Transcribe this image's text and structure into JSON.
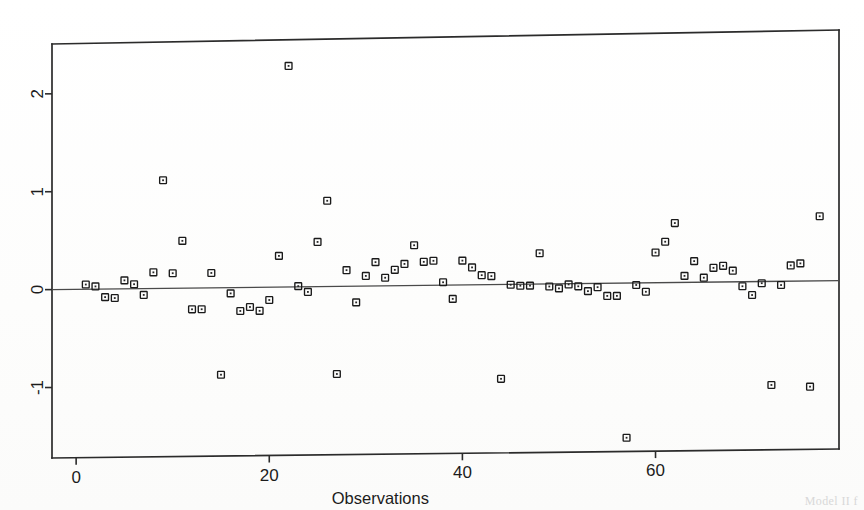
{
  "figure": {
    "kind": "scatter-residual-plot",
    "background": "#ffffff",
    "ink_color": "#1c1c1c",
    "frame": {
      "left": 52,
      "top": 40,
      "right": 839,
      "bottom": 458
    },
    "caption_fragment": "Model II f"
  },
  "chart_data": {
    "type": "scatter",
    "title": "",
    "subtitle": "",
    "xlabel": "Observations",
    "ylabel": "",
    "xlim": [
      -2.5,
      79
    ],
    "ylim": [
      -1.72,
      2.55
    ],
    "xticks": [
      0,
      20,
      40,
      60
    ],
    "xticklabels": [
      "0",
      "20",
      "40",
      "60"
    ],
    "yticks": [
      2,
      1,
      0,
      -1
    ],
    "yticklabels": [
      "2",
      "1",
      "0",
      "-1"
    ],
    "ytick_label_rotation": -90,
    "grid": false,
    "legend": null,
    "marker": "open-square",
    "reference_lines": [
      {
        "orientation": "horizontal",
        "y": 0.0,
        "style": "solid",
        "color": "#4a4a4a"
      }
    ],
    "series": [
      {
        "name": "residuals",
        "x": [
          1,
          2,
          3,
          4,
          5,
          6,
          7,
          8,
          9,
          10,
          11,
          12,
          13,
          14,
          15,
          16,
          17,
          18,
          19,
          20,
          21,
          22,
          23,
          24,
          25,
          26,
          27,
          28,
          29,
          30,
          31,
          32,
          33,
          34,
          35,
          36,
          37,
          38,
          39,
          40,
          41,
          42,
          43,
          44,
          45,
          46,
          47,
          48,
          49,
          50,
          51,
          52,
          53,
          54,
          55,
          56,
          57,
          58,
          59,
          60,
          61,
          62,
          63,
          64,
          65,
          66,
          67,
          68,
          69,
          70,
          71,
          72,
          73,
          74,
          75,
          76,
          77
        ],
        "y": [
          0.05,
          0.03,
          -0.08,
          -0.09,
          0.09,
          0.05,
          -0.06,
          0.17,
          1.11,
          0.16,
          0.49,
          -0.21,
          -0.21,
          0.16,
          -0.88,
          -0.05,
          -0.23,
          -0.19,
          -0.23,
          -0.12,
          0.33,
          2.27,
          0.02,
          -0.04,
          0.47,
          0.89,
          -0.88,
          0.18,
          -0.15,
          0.12,
          0.26,
          0.1,
          0.18,
          0.24,
          0.43,
          0.26,
          0.27,
          0.05,
          -0.12,
          0.27,
          0.2,
          0.12,
          0.11,
          -0.94,
          0.02,
          0.01,
          0.01,
          0.34,
          0.0,
          -0.02,
          0.02,
          0.0,
          -0.05,
          -0.01,
          -0.1,
          -0.1,
          -1.55,
          0.01,
          -0.06,
          0.34,
          0.45,
          0.64,
          0.1,
          0.25,
          0.08,
          0.18,
          0.2,
          0.15,
          -0.01,
          -0.1,
          0.02,
          -1.02,
          0.0,
          0.2,
          0.22,
          -1.04,
          0.7
        ]
      }
    ]
  }
}
